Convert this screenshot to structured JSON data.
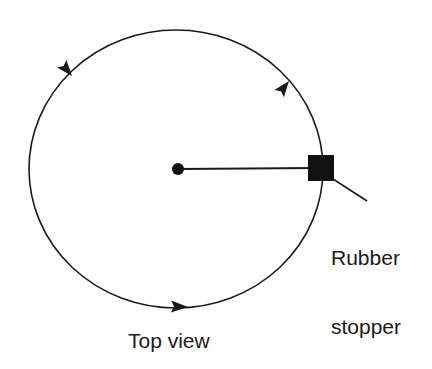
{
  "figure": {
    "background_color": "#ffffff",
    "stroke_color": "#1a1a1a",
    "labels": {
      "stopper_line1": "Rubber",
      "stopper_line2": "stopper",
      "top_view": "Top view"
    },
    "icons": {
      "center_pivot": "center-dot-icon",
      "mass": "rubber-stopper-square-icon",
      "motion_arrow": "arrowhead-icon"
    },
    "geometry": {
      "circle_center_x": 176,
      "circle_center_y": 169,
      "circle_radius_x": 147,
      "circle_radius_y": 139,
      "center_dot_radius": 6,
      "square_size": 26,
      "square_center_x": 321,
      "square_center_y": 168,
      "radius_line_from_x": 178,
      "radius_line_from_y": 169,
      "radius_line_to_x": 314,
      "radius_line_to_y": 168,
      "leader_from_x": 333,
      "leader_from_y": 179,
      "leader_to_x": 367,
      "leader_to_y": 201
    },
    "arrows": [
      {
        "name": "arrow-upper-left",
        "x": 71,
        "y": 76,
        "angle_deg": 228
      },
      {
        "name": "arrow-upper-right",
        "x": 288,
        "y": 80,
        "angle_deg": 312
      },
      {
        "name": "arrow-bottom",
        "x": 172,
        "y": 307,
        "angle_deg": 5
      }
    ],
    "rotation_direction": "counterclockwise"
  }
}
